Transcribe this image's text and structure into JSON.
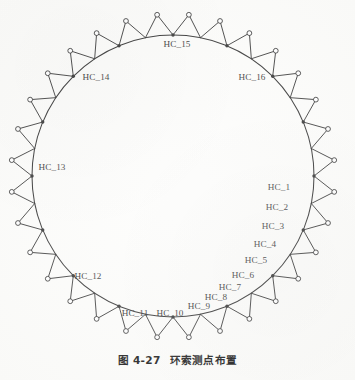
{
  "figure": {
    "caption_number": "图 4-27",
    "caption_text": "环索测点布置",
    "ring_label_prefix": "HC_"
  },
  "colors": {
    "ink": "#1a1a1a",
    "paper": "#fcfcfa",
    "node_fill": "#ffffff",
    "point_fill": "#1a1a1a"
  },
  "labels": [
    {
      "id": "HC_1",
      "text": "HC_1",
      "x": 279,
      "y": 188
    },
    {
      "id": "HC_2",
      "text": "HC_2",
      "x": 277,
      "y": 208
    },
    {
      "id": "HC_3",
      "text": "HC_3",
      "x": 273,
      "y": 227
    },
    {
      "id": "HC_4",
      "text": "HC_4",
      "x": 265,
      "y": 245
    },
    {
      "id": "HC_5",
      "text": "HC_5",
      "x": 256,
      "y": 261
    },
    {
      "id": "HC_6",
      "text": "HC_6",
      "x": 243,
      "y": 276
    },
    {
      "id": "HC_7",
      "text": "HC_7",
      "x": 230,
      "y": 288
    },
    {
      "id": "HC_8",
      "text": "HC_8",
      "x": 216,
      "y": 298
    },
    {
      "id": "HC_9",
      "text": "HC_9",
      "x": 199,
      "y": 307
    },
    {
      "id": "HC_10",
      "text": "HC_10",
      "x": 170,
      "y": 314
    },
    {
      "id": "HC_11",
      "text": "HC_11",
      "x": 135,
      "y": 314
    },
    {
      "id": "HC_12",
      "text": "HC_12",
      "x": 88,
      "y": 277
    },
    {
      "id": "HC_13",
      "text": "HC_13",
      "x": 52,
      "y": 168
    },
    {
      "id": "HC_14",
      "text": "HC_14",
      "x": 96,
      "y": 78
    },
    {
      "id": "HC_15",
      "text": "HC_15",
      "x": 177,
      "y": 45
    },
    {
      "id": "HC_16",
      "text": "HC_16",
      "x": 252,
      "y": 78
    }
  ],
  "ring_geometry": {
    "center_x": 173,
    "center_y": 176,
    "radius": 141,
    "strut_count": 32,
    "outer_node_radius_px": 2.4,
    "measurement_point_count": 16
  }
}
